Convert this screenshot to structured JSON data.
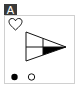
{
  "panel": {
    "label": "A"
  },
  "icons": {
    "heart": "heart-outline-icon",
    "flag": "triangle-flag-icon",
    "filled_dot": "filled-circle-icon",
    "empty_dot": "empty-circle-icon"
  },
  "colors": {
    "stroke": "#111111",
    "fill": "#000000",
    "label_bg": "#3a3a3a",
    "border": "#d0d0d0"
  }
}
